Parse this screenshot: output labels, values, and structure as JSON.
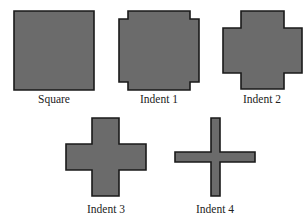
{
  "figure": {
    "colors": {
      "fill": "#6b6b6b",
      "stroke": "#1a1a1a",
      "label": "#222222",
      "background": "#ffffff"
    },
    "shapes": [
      {
        "id": "square",
        "label": "Square",
        "path": "M14,11 H94 V90 H14 Z",
        "label_x": 54,
        "label_y": 94
      },
      {
        "id": "indent-1",
        "label": "Indent 1",
        "path": "M128,11 H190 V19 H199 V82 H190 V90 H128 V82 H119 V19 H128 Z",
        "label_x": 159,
        "label_y": 94
      },
      {
        "id": "indent-2",
        "label": "Indent 2",
        "path": "M241,11 H284 V28 H302 V73 H284 V89 H241 V73 H223 V28 H241 Z",
        "label_x": 262,
        "label_y": 94
      },
      {
        "id": "indent-3",
        "label": "Indent 3",
        "path": "M92,118 H119 V144 H146 V170 H119 V196 H92 V170 H66 V144 H92 Z",
        "label_x": 106,
        "label_y": 204
      },
      {
        "id": "indent-4",
        "label": "Indent 4",
        "path": "M211,118 H220 V152 H255 V162 H220 V196 H211 V162 H175 V152 H211 Z",
        "label_x": 215,
        "label_y": 204
      }
    ]
  }
}
